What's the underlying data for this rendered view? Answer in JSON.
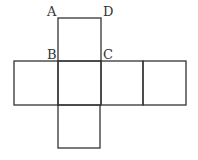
{
  "diagram": {
    "type": "cube-net",
    "labels": [
      {
        "id": "A",
        "text": "A",
        "x": 47,
        "y": 16
      },
      {
        "id": "D",
        "text": "D",
        "x": 103,
        "y": 16
      },
      {
        "id": "B",
        "text": "B",
        "x": 47,
        "y": 59
      },
      {
        "id": "C",
        "text": "C",
        "x": 103,
        "y": 59
      }
    ],
    "squares": [
      {
        "name": "top",
        "x": 58,
        "y": 18,
        "w": 43,
        "h": 43
      },
      {
        "name": "left",
        "x": 14,
        "y": 61,
        "w": 44,
        "h": 44
      },
      {
        "name": "center",
        "x": 58,
        "y": 61,
        "w": 43,
        "h": 44
      },
      {
        "name": "right-1",
        "x": 101,
        "y": 61,
        "w": 42,
        "h": 44
      },
      {
        "name": "right-2",
        "x": 143,
        "y": 61,
        "w": 43,
        "h": 44
      },
      {
        "name": "bottom",
        "x": 58,
        "y": 105,
        "w": 42,
        "h": 43
      }
    ],
    "stroke_color": "#333333"
  }
}
